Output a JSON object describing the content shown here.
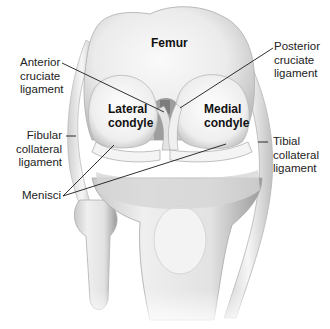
{
  "figure": {
    "type": "anatomical-illustration"
  },
  "bone_labels": {
    "femur": "Femur",
    "lateral_condyle": [
      "Lateral",
      "condyle"
    ],
    "medial_condyle": [
      "Medial",
      "condyle"
    ]
  },
  "callouts": {
    "anterior_cruciate": [
      "Anterior",
      "cruciate",
      "ligament"
    ],
    "posterior_cruciate": [
      "Posterior",
      "cruciate",
      "ligament"
    ],
    "fibular_collateral": [
      "Fibular",
      "collateral",
      "ligament"
    ],
    "tibial_collateral": [
      "Tibial",
      "collateral",
      "ligament"
    ],
    "menisci": "Menisci"
  },
  "colors": {
    "background": "#ffffff",
    "bone_light": "#f2f2f2",
    "bone_mid": "#d9d9d9",
    "bone_shadow": "#a8a8a8",
    "leader_line": "#1a1a1a",
    "text": "#222222"
  }
}
